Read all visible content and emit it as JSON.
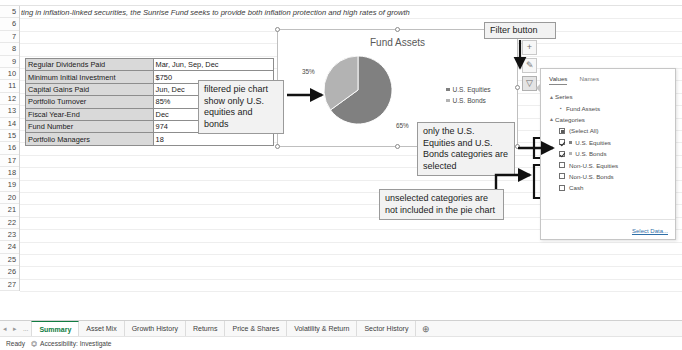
{
  "document": {
    "description_row": "ting in inflation-linked securities, the Sunrise Fund seeks to provide both inflation protection and high rates of growth"
  },
  "row_headers": [
    "5",
    "6",
    "7",
    "8",
    "9",
    "10",
    "11",
    "12",
    "13",
    "14",
    "15",
    "16",
    "17",
    "18",
    "19",
    "20",
    "21",
    "22",
    "23",
    "24",
    "25",
    "26",
    "27"
  ],
  "facts_table": {
    "rows": [
      {
        "label": "Regular Dividends Paid",
        "value": "Mar, Jun, Sep, Dec"
      },
      {
        "label": "Minimum Initial Investment",
        "value": "$750"
      },
      {
        "label": "Capital Gains Paid",
        "value": "Jun, Dec"
      },
      {
        "label": "Portfolio Turnover",
        "value": "85%"
      },
      {
        "label": "Fiscal Year-End",
        "value": "Dec"
      },
      {
        "label": "Fund Number",
        "value": "974"
      },
      {
        "label": "Portfolio Managers",
        "value": "18"
      }
    ]
  },
  "chart": {
    "title": "Fund Assets",
    "labels": {
      "slice_a": "35%",
      "slice_b": "65%"
    },
    "legend": [
      {
        "name": "U.S. Equities",
        "color": "#808080"
      },
      {
        "name": "U.S. Bonds",
        "color": "#b3b3b3"
      }
    ]
  },
  "chart_data": {
    "type": "pie",
    "title": "Fund Assets",
    "categories": [
      "U.S. Equities",
      "U.S. Bonds"
    ],
    "values": [
      65,
      35
    ],
    "value_labels": [
      "65%",
      "35%"
    ],
    "colors": [
      "#808080",
      "#b3b3b3"
    ],
    "legend_position": "right",
    "filtered_out_categories": [
      "Non-U.S. Equities",
      "Non-U.S. Bonds",
      "Cash"
    ],
    "series_name": "Fund Assets"
  },
  "chart_side_buttons": [
    {
      "name": "chart-elements-button",
      "glyph": "+",
      "active": false
    },
    {
      "name": "chart-styles-button",
      "glyph": "✎",
      "active": false
    },
    {
      "name": "chart-filters-button",
      "glyph": "▽",
      "active": true
    }
  ],
  "filter_pane": {
    "tabs": [
      {
        "label": "Values",
        "selected": true
      },
      {
        "label": "Names",
        "selected": false
      }
    ],
    "groups": [
      {
        "label": "Series",
        "expanded": true,
        "items": [
          {
            "label": "Fund Assets",
            "marker": "series-marker",
            "checkbox": null
          }
        ]
      },
      {
        "label": "Categories",
        "expanded": true,
        "items": [
          {
            "label": "(Select All)",
            "checkbox": "partial",
            "swatch": null
          },
          {
            "label": "U.S. Equities",
            "checkbox": "checked",
            "swatch": "#808080"
          },
          {
            "label": "U.S. Bonds",
            "checkbox": "checked",
            "swatch": "#b3b3b3"
          },
          {
            "label": "Non-U.S. Equities",
            "checkbox": "unchecked",
            "swatch": null
          },
          {
            "label": "Non-U.S. Bonds",
            "checkbox": "unchecked",
            "swatch": null
          },
          {
            "label": "Cash",
            "checkbox": "unchecked",
            "swatch": null
          }
        ]
      }
    ],
    "select_data_link": "Select Data..."
  },
  "annotations": {
    "filter_button": "Filter button",
    "pie_note": "filtered pie chart show only U.S. equities and bonds",
    "selected_note": "only the U.S. Equities and U.S. Bonds categories are selected",
    "unselected_note": "unselected categories are not included in the pie chart"
  },
  "sheet_tabs": [
    {
      "label": "Summary",
      "active": true
    },
    {
      "label": "Asset Mix",
      "active": false
    },
    {
      "label": "Growth History",
      "active": false
    },
    {
      "label": "Returns",
      "active": false
    },
    {
      "label": "Price & Shares",
      "active": false
    },
    {
      "label": "Volatility & Return",
      "active": false
    },
    {
      "label": "Sector History",
      "active": false
    }
  ],
  "tabbar": {
    "add_sheet_glyph": "⊕",
    "nav_prev": "◂",
    "nav_next": "▸",
    "nav_more": "..."
  },
  "statusbar": {
    "state": "Ready",
    "accessibility": "Accessibility: Investigate"
  },
  "colors": {
    "slice_dark": "#808080",
    "slice_light": "#b3b3b3",
    "accent_green": "#107c41"
  }
}
